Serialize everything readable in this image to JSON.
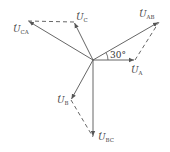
{
  "diagram": {
    "type": "phasor",
    "origin": [
      93,
      60
    ],
    "colors": {
      "line": "#555555",
      "label": "#444444"
    },
    "phasors": [
      {
        "name": "U_A",
        "label_main": "U",
        "label_sub": "A",
        "tip": [
          135,
          60
        ],
        "style": "solid"
      },
      {
        "name": "U_B",
        "label_main": "U",
        "label_sub": "B",
        "tip": [
          71,
          100
        ],
        "style": "solid"
      },
      {
        "name": "U_C",
        "label_main": "U",
        "label_sub": "C",
        "tip": [
          74,
          22
        ],
        "style": "solid"
      },
      {
        "name": "U_AB",
        "label_main": "U",
        "label_sub": "AB",
        "tip": [
          159,
          22
        ],
        "style": "solid"
      },
      {
        "name": "U_BC",
        "label_main": "U",
        "label_sub": "BC",
        "tip": [
          93,
          137
        ],
        "style": "solid"
      },
      {
        "name": "U_CA",
        "label_main": "U",
        "label_sub": "CA",
        "tip": [
          28,
          21
        ],
        "style": "solid"
      }
    ],
    "dashed_segments": [
      {
        "from": [
          135,
          60
        ],
        "to": [
          159,
          22
        ]
      },
      {
        "from": [
          71,
          100
        ],
        "to": [
          93,
          137
        ]
      },
      {
        "from": [
          74,
          22
        ],
        "to": [
          28,
          21
        ]
      }
    ],
    "angle_label": "30°"
  },
  "labels": {
    "ua": {
      "main": "U",
      "sub": "A"
    },
    "ub": {
      "main": "U",
      "sub": "B"
    },
    "uc": {
      "main": "U",
      "sub": "C"
    },
    "uab": {
      "main": "U",
      "sub": "AB"
    },
    "ubc": {
      "main": "U",
      "sub": "BC"
    },
    "uca": {
      "main": "U",
      "sub": "CA"
    },
    "dot": "·",
    "angle": "30°"
  }
}
